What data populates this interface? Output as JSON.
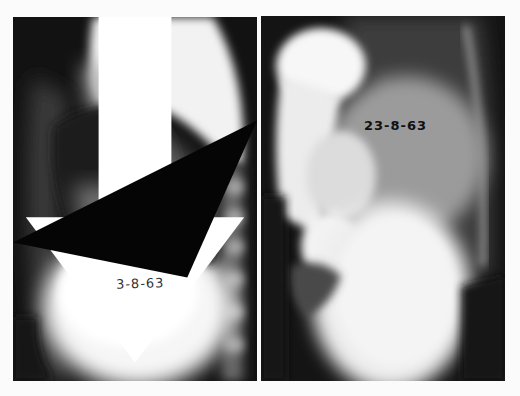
{
  "figure": {
    "panels": [
      {
        "id": "left",
        "description": "Lateral chest radiograph",
        "date_label": "3-8-63",
        "annotations": [
          "white-arrow",
          "black-arrowhead"
        ]
      },
      {
        "id": "right",
        "description": "Lateral radiograph with barium contrast",
        "date_label": "23-8-63"
      }
    ],
    "colors": {
      "background": "#fbfbfb",
      "film_dark": "#111111",
      "film_bright": "#f4f4f4"
    }
  }
}
